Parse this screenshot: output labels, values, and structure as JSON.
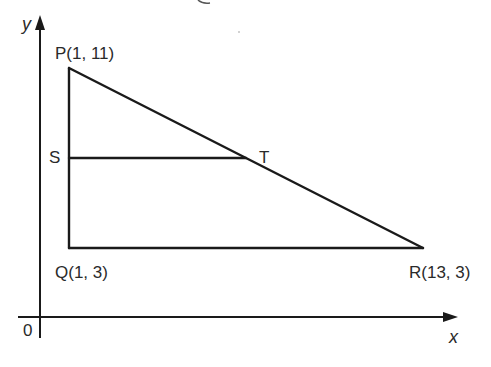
{
  "diagram": {
    "type": "coordinate-geometry",
    "axes": {
      "x_label": "x",
      "y_label": "y",
      "origin_label": "0"
    },
    "points": {
      "P": {
        "label": "P(1, 11)",
        "x": 1,
        "y": 11
      },
      "Q": {
        "label": "Q(1, 3)",
        "x": 1,
        "y": 3
      },
      "R": {
        "label": "R(13, 3)",
        "x": 13,
        "y": 3
      },
      "S": {
        "label": "S"
      },
      "T": {
        "label": "T"
      }
    },
    "segments": [
      "PQ",
      "QR",
      "PR",
      "ST"
    ],
    "colors": {
      "line": "#1a1a1a",
      "text": "#2a2a2a",
      "background": "#ffffff"
    }
  }
}
